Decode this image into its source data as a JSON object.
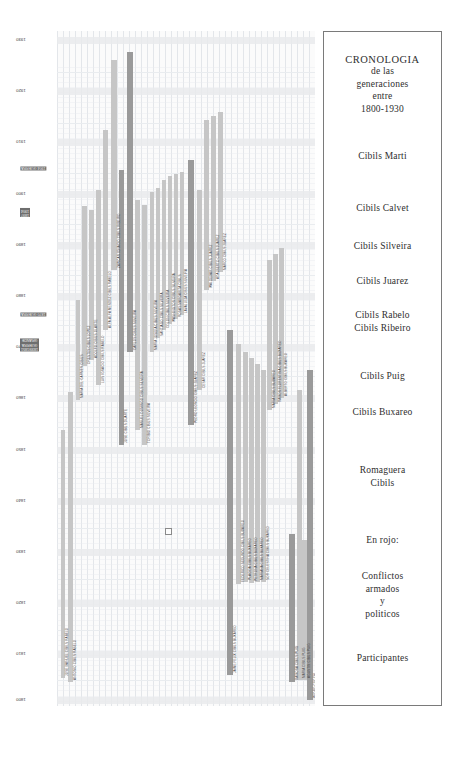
{
  "title_block": {
    "lines": [
      "CRONOLOGIA",
      "de las",
      "generaciones",
      "entre",
      "1800-1930"
    ]
  },
  "legend": {
    "groups": [
      {
        "name": "cibils-marti",
        "lines": [
          "Cibils Marti"
        ],
        "top": 118
      },
      {
        "name": "cibils-calvet",
        "lines": [
          "Cibils Calvet"
        ],
        "top": 170
      },
      {
        "name": "cibils-silveira",
        "lines": [
          "Cibils Silveira"
        ],
        "top": 208
      },
      {
        "name": "cibils-juarez",
        "lines": [
          "Cibils Juarez"
        ],
        "top": 243
      },
      {
        "name": "cibils-rabelo-ribeiro",
        "lines": [
          "Cibils Rabelo",
          "Cibils Ribeiro"
        ],
        "top": 277
      },
      {
        "name": "cibils-puig",
        "lines": [
          "Cibils Puig"
        ],
        "top": 338
      },
      {
        "name": "cibils-buxareo",
        "lines": [
          "Cibils Buxareo"
        ],
        "top": 374
      },
      {
        "name": "romaguera-cibils",
        "lines": [
          "Romaguera",
          "Cibils"
        ],
        "top": 432
      },
      {
        "name": "en-rojo",
        "lines": [
          "En rojo:"
        ],
        "top": 502
      },
      {
        "name": "conflictos",
        "lines": [
          "Conflictos",
          "armados",
          "y",
          "politicos"
        ],
        "top": 538
      },
      {
        "name": "participantes",
        "lines": [
          "Participantes"
        ],
        "top": 620
      }
    ]
  },
  "chart_data": {
    "type": "bar",
    "title": "CRONOLOGIA de las generaciones entre 1800-1930",
    "xlabel": "",
    "ylabel": "",
    "orientation": "vertical-timeline",
    "ylim": [
      1800,
      1935
    ],
    "grid": true,
    "legend_position": "right",
    "axis_years": [
      {
        "label": "1930",
        "y": 40
      },
      {
        "label": "1920",
        "y": 91
      },
      {
        "label": "1910",
        "y": 142
      },
      {
        "label": "1900",
        "y": 194
      },
      {
        "label": "1890",
        "y": 245
      },
      {
        "label": "1880",
        "y": 296
      },
      {
        "label": "1870",
        "y": 347
      },
      {
        "label": "1860",
        "y": 398
      },
      {
        "label": "1850",
        "y": 450
      },
      {
        "label": "1840",
        "y": 501
      },
      {
        "label": "1830",
        "y": 552
      },
      {
        "label": "1820",
        "y": 603
      },
      {
        "label": "1810",
        "y": 654
      },
      {
        "label": "1800",
        "y": 700
      }
    ],
    "events_red": [
      {
        "label": "1904 GUERRA",
        "y": 170
      },
      {
        "label": "1897\\n1904",
        "y": 212
      },
      {
        "label": "1870 GUERRA",
        "y": 316
      },
      {
        "label": "1839/1851\\nGUERRA\\nGRANDE",
        "y": 342
      }
    ],
    "event_marker_text": "1865/1870",
    "people": [
      {
        "name": "JOSE MANUEL CIBILS RABELO",
        "x": 4,
        "y": 430,
        "h": 248,
        "w": 4,
        "cls": "gen"
      },
      {
        "name": "ANTONIO CIBILS RABELO",
        "x": 11,
        "y": 392,
        "h": 290,
        "w": 5,
        "cls": "gen"
      },
      {
        "name": "MARIA DEL CARMEN CIBILS",
        "x": 19,
        "y": 300,
        "h": 100,
        "w": 4,
        "cls": "gen"
      },
      {
        "name": "ORESTES CIBILS LOPEZ",
        "x": 25,
        "y": 206,
        "h": 160,
        "w": 5,
        "cls": "gen"
      },
      {
        "name": "ADOLFO CIBILS OLARTE",
        "x": 32,
        "y": 210,
        "h": 150,
        "w": 5,
        "cls": "gen"
      },
      {
        "name": "LUIS IGNACIO CIBILS RABELO",
        "x": 39,
        "y": 190,
        "h": 195,
        "w": 5,
        "cls": "gen"
      },
      {
        "name": "ALFA-ALFA MENDEZ CIBILS RABELO",
        "x": 46,
        "y": 130,
        "h": 200,
        "w": 5,
        "cls": "gen"
      },
      {
        "name": "ZAPICAN IGNACIO CIBILS RIBEIRO",
        "x": 54,
        "y": 60,
        "h": 210,
        "w": 6,
        "cls": "gen"
      },
      {
        "name": "JOSE CIBILS DUARTE",
        "x": 62,
        "y": 170,
        "h": 275,
        "w": 5,
        "cls": "dk"
      },
      {
        "name": "CARLOS CIBILS SILVEIRA",
        "x": 70,
        "y": 52,
        "h": 300,
        "w": 6,
        "cls": "dk"
      },
      {
        "name": "MANUEL DOMINGO CIBILS SILVEIRA",
        "x": 78,
        "y": 200,
        "h": 230,
        "w": 5,
        "cls": "gen"
      },
      {
        "name": "TORIBIO CIBILS SILVEIRA",
        "x": 85,
        "y": 205,
        "h": 240,
        "w": 5,
        "cls": "gen"
      },
      {
        "name": "MARIA JOSEFA CIBILS SILVEIRA",
        "x": 93,
        "y": 192,
        "h": 160,
        "w": 4,
        "cls": "gen"
      },
      {
        "name": "SANTIAGO CIBILS SILVEIRA",
        "x": 99,
        "y": 188,
        "h": 150,
        "w": 4,
        "cls": "gen"
      },
      {
        "name": "COLON CIBILS SILVEIRA",
        "x": 105,
        "y": 180,
        "h": 150,
        "w": 4,
        "cls": "gen"
      },
      {
        "name": "WASHINGTON CIBILS SILVEIRA",
        "x": 111,
        "y": 176,
        "h": 148,
        "w": 4,
        "cls": "gen"
      },
      {
        "name": "ROSAS MARGARITA CIBILS",
        "x": 117,
        "y": 174,
        "h": 145,
        "w": 4,
        "cls": "gen"
      },
      {
        "name": "LAVALLEJA CIBILS SILVEIRA",
        "x": 123,
        "y": 172,
        "h": 143,
        "w": 4,
        "cls": "gen"
      },
      {
        "name": "PEDRO LEONCIO CIBILS JUAREZ",
        "x": 131,
        "y": 160,
        "h": 265,
        "w": 6,
        "cls": "dk"
      },
      {
        "name": "CESAR CIBILS JUAREZ",
        "x": 140,
        "y": 190,
        "h": 200,
        "w": 5,
        "cls": "gen"
      },
      {
        "name": "WALDEMAR CIBILS JUAREZ",
        "x": 147,
        "y": 120,
        "h": 170,
        "w": 5,
        "cls": "gen"
      },
      {
        "name": "ADALBERTO CIBILS JUAREZ",
        "x": 154,
        "y": 116,
        "h": 165,
        "w": 5,
        "cls": "gen"
      },
      {
        "name": "MARCO CIBILS JUAREZ",
        "x": 161,
        "y": 112,
        "h": 160,
        "w": 5,
        "cls": "gen"
      },
      {
        "name": "JAIME FELIX CIBILS BUXAREO",
        "x": 170,
        "y": 330,
        "h": 345,
        "w": 6,
        "cls": "dk"
      },
      {
        "name": "FEDERICO SEGUNDO CIBILS BUXAREO",
        "x": 179,
        "y": 344,
        "h": 240,
        "w": 5,
        "cls": "gen"
      },
      {
        "name": "PLACIDA CIBILS BUXAREO",
        "x": 186,
        "y": 352,
        "h": 230,
        "w": 5,
        "cls": "gen"
      },
      {
        "name": "PETRONA CIBILS BUXAREO",
        "x": 192,
        "y": 358,
        "h": 225,
        "w": 5,
        "cls": "gen"
      },
      {
        "name": "MARIANA CIBILS BUXAREO",
        "x": 198,
        "y": 364,
        "h": 218,
        "w": 5,
        "cls": "gen"
      },
      {
        "name": "SOR CELESTINA CIBILS BUXAREO",
        "x": 204,
        "y": 370,
        "h": 212,
        "w": 5,
        "cls": "gen"
      },
      {
        "name": "MARIA CIBILS BUXAREO",
        "x": 210,
        "y": 260,
        "h": 150,
        "w": 5,
        "cls": "gen"
      },
      {
        "name": "RAMON FLORENTINA CIBILS BUXAREO",
        "x": 216,
        "y": 254,
        "h": 150,
        "w": 5,
        "cls": "gen"
      },
      {
        "name": "ALBERTO CIBILS BUXAREO",
        "x": 222,
        "y": 248,
        "h": 150,
        "w": 5,
        "cls": "gen"
      },
      {
        "name": "RAMONA CIBILS PUIG",
        "x": 232,
        "y": 534,
        "h": 148,
        "w": 6,
        "cls": "dk"
      },
      {
        "name": "MARIA CIBILS PUIG",
        "x": 240,
        "y": 390,
        "h": 290,
        "w": 5,
        "cls": "gen"
      },
      {
        "name": "PEDRO COCCHI",
        "x": 250,
        "y": 370,
        "h": 330,
        "w": 6,
        "cls": "dk"
      },
      {
        "name": "AGUSTIN CIBILS PUIG",
        "x": 245,
        "y": 540,
        "h": 140,
        "w": 5,
        "cls": "gen"
      }
    ]
  }
}
